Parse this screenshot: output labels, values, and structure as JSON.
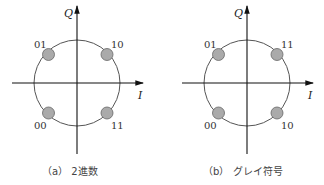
{
  "figures": [
    {
      "id": "a",
      "caption": "（a） 2進数",
      "axis_x_label": "I",
      "axis_y_label": "Q",
      "points": {
        "top_left": "01",
        "top_right": "10",
        "bottom_left": "00",
        "bottom_right": "11"
      }
    },
    {
      "id": "b",
      "caption": "（b） グレイ符号",
      "axis_x_label": "I",
      "axis_y_label": "Q",
      "points": {
        "top_left": "01",
        "top_right": "11",
        "bottom_left": "00",
        "bottom_right": "10"
      }
    }
  ],
  "colors": {
    "axis": "#111111",
    "circle": "#555555",
    "point_fill": "#aaaaaa",
    "point_stroke": "#666666"
  }
}
